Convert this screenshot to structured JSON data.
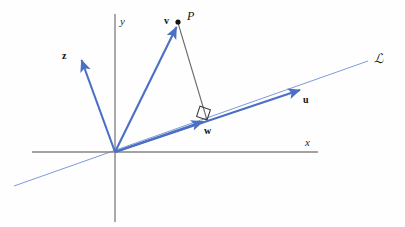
{
  "figure": {
    "width": 405,
    "height": 227,
    "background_color": "#fefefe"
  },
  "colors": {
    "vector_blue": "#4a6fc4",
    "line_blue": "#6d8fd4",
    "axis_gray": "#808080",
    "segment_gray": "#6b6b6b",
    "label_black": "#111111"
  },
  "axes": {
    "x_label": "x",
    "y_label": "y",
    "origin": {
      "x": 115,
      "y": 152
    },
    "x_start": {
      "x": 32,
      "y": 152
    },
    "x_end": {
      "x": 318,
      "y": 152
    },
    "y_start": {
      "x": 115,
      "y": 14
    },
    "y_end": {
      "x": 115,
      "y": 222
    }
  },
  "line": {
    "label": "ℒ",
    "label_x": 374,
    "label_y": 52,
    "start": {
      "x": 14,
      "y": 186
    },
    "end": {
      "x": 368,
      "y": 61
    }
  },
  "vectors": [
    {
      "name": "v",
      "label": "v",
      "label_x": 164,
      "label_y": 16,
      "from": {
        "x": 115,
        "y": 152
      },
      "to": {
        "x": 178,
        "y": 23
      },
      "color": "#4a6fc4"
    },
    {
      "name": "z",
      "label": "z",
      "label_x": 62,
      "label_y": 51,
      "from": {
        "x": 115,
        "y": 152
      },
      "to": {
        "x": 80,
        "y": 56
      },
      "color": "#4a6fc4"
    },
    {
      "name": "u",
      "label": "u",
      "label_x": 303,
      "label_y": 95,
      "from": {
        "x": 115,
        "y": 152
      },
      "to": {
        "x": 306,
        "y": 88
      },
      "color": "#4a6fc4"
    },
    {
      "name": "w",
      "label": "w",
      "label_x": 204,
      "label_y": 126,
      "from": {
        "x": 115,
        "y": 152
      },
      "to": {
        "x": 207,
        "y": 120
      },
      "color": "#4a6fc4"
    }
  ],
  "point": {
    "label": "P",
    "label_x": 187,
    "label_y": 12,
    "x": 178,
    "y": 22,
    "radius": 2.6
  },
  "perpendicular_segment": {
    "from": {
      "x": 178,
      "y": 23
    },
    "to": {
      "x": 207,
      "y": 120
    },
    "color": "#6b6b6b"
  },
  "right_angle_marker": {
    "size": 11,
    "vertex": {
      "x": 207,
      "y": 120
    },
    "color": "#3b3b3b"
  }
}
